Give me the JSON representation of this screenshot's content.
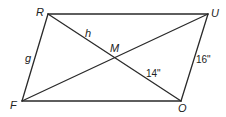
{
  "diagram": {
    "type": "parallelogram-with-diagonals",
    "vertices": {
      "R": {
        "label": "R",
        "x": 48,
        "y": 14
      },
      "U": {
        "label": "U",
        "x": 208,
        "y": 14
      },
      "O": {
        "label": "O",
        "x": 181,
        "y": 101
      },
      "F": {
        "label": "F",
        "x": 22,
        "y": 101
      }
    },
    "intersection": {
      "label": "M",
      "x": 114,
      "y": 57
    },
    "segment_labels": {
      "h": {
        "text": "h",
        "segment": "RM"
      },
      "g": {
        "text": "g",
        "segment": "RF"
      },
      "mo": {
        "text": "14\"",
        "segment": "MO"
      },
      "uo": {
        "text": "16\"",
        "segment": "UO"
      }
    },
    "colors": {
      "line": "#2a2a2a",
      "text": "#222222",
      "background": "#ffffff"
    }
  }
}
